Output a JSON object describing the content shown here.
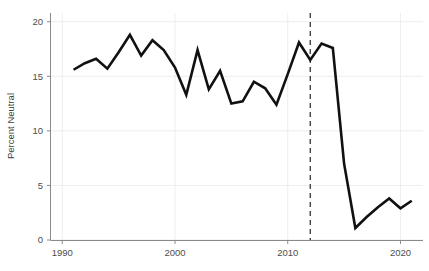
{
  "chart_data": {
    "type": "line",
    "title": "",
    "subtitle": "",
    "xlabel": "",
    "ylabel": "Percent Neutral",
    "xlim": [
      1989.0,
      2022.0
    ],
    "ylim": [
      0,
      20.8
    ],
    "grid": true,
    "legend": null,
    "legend_position": "none",
    "x_ticks": [
      1990,
      2000,
      2010,
      2020
    ],
    "x_tick_labels": [
      "1990",
      "2000",
      "2010",
      "2020"
    ],
    "y_ticks": [
      0,
      5,
      10,
      15,
      20
    ],
    "y_tick_labels": [
      "0",
      "5",
      "10",
      "15",
      "20"
    ],
    "line_color": "#111111",
    "grid_color": "#e9e9ef",
    "axis_color": "#8a8a8a",
    "annotations": [
      {
        "name": "event-reference-line",
        "type": "vline",
        "x": 2012,
        "style": "dashed",
        "color": "#444444",
        "label": ""
      }
    ],
    "x": [
      1991,
      1992,
      1993,
      1994,
      1995,
      1996,
      1997,
      1998,
      1999,
      2000,
      2001,
      2002,
      2003,
      2004,
      2005,
      2006,
      2007,
      2008,
      2009,
      2010,
      2011,
      2012,
      2013,
      2014,
      2015,
      2016,
      2017,
      2018,
      2019,
      2020,
      2021
    ],
    "series": [
      {
        "name": "Percent Neutral",
        "values": [
          15.6,
          16.2,
          16.6,
          15.7,
          17.2,
          18.8,
          16.9,
          18.3,
          17.4,
          15.8,
          13.3,
          17.4,
          13.8,
          15.5,
          12.5,
          12.7,
          14.5,
          13.9,
          12.4,
          15.2,
          18.1,
          16.5,
          18.0,
          17.6,
          7.0,
          1.1,
          2.1,
          3.0,
          3.8,
          2.9,
          3.6
        ]
      }
    ]
  },
  "axes": {
    "y_axis_title": "Percent Neutral"
  }
}
